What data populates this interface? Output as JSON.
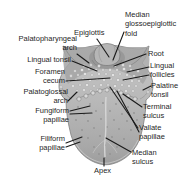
{
  "figure": {
    "colors": {
      "background": "#ffffff",
      "label_text": "#1f1f1f",
      "leader_line": "#1a1a1a",
      "tongue_body": "#b9b9b9",
      "tongue_outline": "#7f7f7f",
      "root_shadow": "#8d8d8d",
      "follicle_fill": "#e6e6e6",
      "vallate_fill": "#d8d8d8",
      "median_sulcus_line": "#d9d9d9"
    },
    "labels": {
      "epiglottis": "Epiglottis",
      "median_glossoepiglottic_fold": "Median\nglossoepiglottic\nfold",
      "palatopharyngeal_arch": "Palatopharyngeal\narch",
      "lingual_tonsil": "Lingual tonsil",
      "foramen_cecum": "Foramen\ncecum",
      "palatoglossal_arch": "Palatoglossal\narch",
      "fungiform_papillae": "Fungiform\npapillae",
      "filiform_papillae": "Filiform\npapillae",
      "apex": "Apex",
      "root": "Root",
      "lingual_follicles": "Lingual\nfollicles",
      "palatine_tonsil": "Palatine\ntonsil",
      "terminal_sulcus": "Terminal\nsulcus",
      "vallate_papillae": "Vallate\npapillae",
      "median_sulcus": "Median\nsulcus"
    }
  }
}
